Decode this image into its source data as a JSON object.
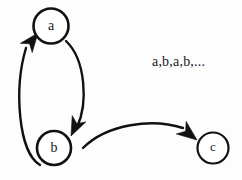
{
  "diagram": {
    "type": "state-transition-graph",
    "width": 242,
    "height": 180,
    "background_color": "#fdfdfd",
    "stroke_color": "#111111",
    "nodes": [
      {
        "id": "a",
        "label": "a",
        "cx": 51,
        "cy": 26,
        "r": 17.5,
        "stroke_width": 2.6,
        "font_size": 14
      },
      {
        "id": "b",
        "label": "b",
        "cx": 54,
        "cy": 148,
        "r": 17,
        "stroke_width": 2.6,
        "font_size": 14
      },
      {
        "id": "c",
        "label": "c",
        "cx": 213,
        "cy": 148,
        "r": 15.5,
        "stroke_width": 2.2,
        "font_size": 13
      }
    ],
    "edges": [
      {
        "id": "edge-b-to-a",
        "from": "b",
        "to": "a",
        "path": "M 40 165 C 18 152 14 88 26 48",
        "stroke_width": 2.4,
        "arrow": {
          "tip_x": 38,
          "tip_y": 33,
          "angle_deg": -52,
          "length": 19,
          "half_width": 7.5
        }
      },
      {
        "id": "edge-a-to-b",
        "from": "a",
        "to": "b",
        "path": "M 66 41 C 86 60 88 104 77 127",
        "stroke_width": 2.4,
        "arrow": {
          "tip_x": 71,
          "tip_y": 136,
          "angle_deg": 115,
          "length": 19,
          "half_width": 7.5
        }
      },
      {
        "id": "edge-b-to-c",
        "from": "b",
        "to": "c",
        "path": "M 83 148 C 107 124 152 118 183 128",
        "stroke_width": 2.4,
        "arrow": {
          "tip_x": 197,
          "tip_y": 140,
          "angle_deg": 38,
          "length": 20,
          "half_width": 8
        }
      }
    ],
    "annotations": [
      {
        "id": "sequence-label",
        "text": "a,b,a,b,...",
        "x": 152,
        "y": 66,
        "font_size": 14
      }
    ]
  }
}
